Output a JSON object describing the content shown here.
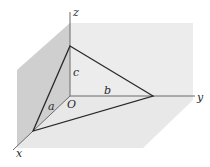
{
  "diagram": {
    "type": "3d-coordinate-plane-intercepts",
    "axes": {
      "x_label": "x",
      "y_label": "y",
      "z_label": "z"
    },
    "origin_label": "O",
    "intercepts": {
      "x_intercept_label": "a",
      "y_intercept_label": "b",
      "z_intercept_label": "c"
    },
    "colors": {
      "left_wall": "#cfcfcf",
      "back_wall": "#ececec",
      "floor": "#e6e6e6",
      "axis_line": "#6a6a6a",
      "triangle_edge": "#2a2a2a",
      "background": "#ffffff"
    }
  }
}
